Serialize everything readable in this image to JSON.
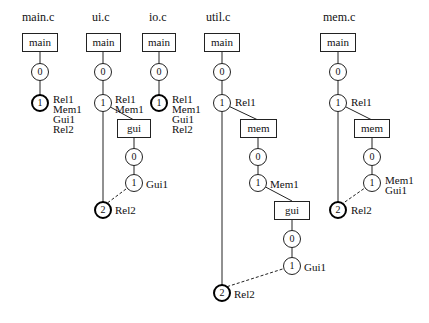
{
  "diagrams": [
    {
      "title": "main.c",
      "nodes": {
        "main": "main",
        "n0": "0",
        "n1": "1"
      },
      "labels": {
        "n1": "Rel1\nMem1\nGui1\nRel2"
      }
    },
    {
      "title": "ui.c",
      "nodes": {
        "main": "main",
        "n0": "0",
        "n1": "1",
        "gui": "gui",
        "g0": "0",
        "g1": "1",
        "n2": "2"
      },
      "labels": {
        "n1": "Rel1\nMem1",
        "g1": "Gui1",
        "n2": "Rel2"
      }
    },
    {
      "title": "io.c",
      "nodes": {
        "main": "main",
        "n0": "0",
        "n1": "1"
      },
      "labels": {
        "n1": "Rel1\nMem1\nGui1\nRel2"
      }
    },
    {
      "title": "util.c",
      "nodes": {
        "main": "main",
        "n0": "0",
        "n1": "1",
        "mem": "mem",
        "m0": "0",
        "m1": "1",
        "gui": "gui",
        "g0": "0",
        "g1": "1",
        "n2": "2"
      },
      "labels": {
        "n1": "Rel1",
        "m1": "Mem1",
        "g1": "Gui1",
        "n2": "Rel2"
      }
    },
    {
      "title": "mem.c",
      "nodes": {
        "main": "main",
        "n0": "0",
        "n1": "1",
        "mem": "mem",
        "m0": "0",
        "m1": "1",
        "n2": "2"
      },
      "labels": {
        "n1": "Rel1",
        "m1": "Mem1\nGui1",
        "n2": "Rel2"
      }
    }
  ]
}
